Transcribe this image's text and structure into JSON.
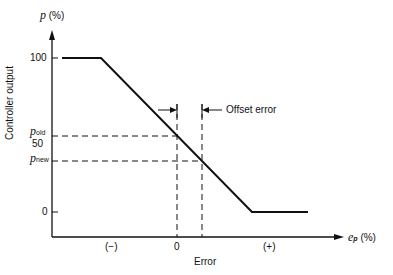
{
  "diagram": {
    "y_axis_label": "p",
    "y_axis_unit": "(%)",
    "y_axis_title": "Controller output",
    "x_axis_label": "e",
    "x_axis_label_sub": "p",
    "x_axis_unit": "(%)",
    "x_axis_title": "Error",
    "y_ticks": {
      "t100": "100",
      "t50": "50",
      "t0": "0"
    },
    "p_old": {
      "main": "p",
      "sub": "old"
    },
    "p_new": {
      "main": "p",
      "sub": "new"
    },
    "x_ticks": {
      "neg": "(−)",
      "zero": "0",
      "pos": "(+)"
    },
    "annotation": "Offset error"
  }
}
